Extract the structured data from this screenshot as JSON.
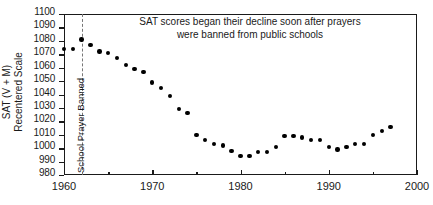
{
  "chart_data": {
    "type": "scatter",
    "title": "",
    "annotation": "SAT scores began their decline soon after prayers were banned from public schools",
    "annotation_line1": "SAT scores began their decline soon after prayers",
    "annotation_line2": "were banned from public schools",
    "xlabel": "",
    "ylabel": "SAT (V + M)  Recentered Scale",
    "ylabel_line1": "SAT (V + M)",
    "ylabel_line2": "Recentered Scale",
    "xlim": [
      1960,
      2000
    ],
    "ylim": [
      980,
      1100
    ],
    "xticks": [
      1960,
      1970,
      1980,
      1990,
      2000
    ],
    "xticklabels": [
      "1960",
      "1970",
      "1980",
      "1990",
      "2000"
    ],
    "xminorticks": [
      1965,
      1975,
      1985,
      1995
    ],
    "yticks": [
      980,
      990,
      1000,
      1010,
      1020,
      1030,
      1040,
      1050,
      1060,
      1070,
      1080,
      1090,
      1100
    ],
    "yticklabels": [
      "980",
      "990",
      "1000",
      "1010",
      "1020",
      "1030",
      "1040",
      "1050",
      "1060",
      "1070",
      "1080",
      "1090",
      "1100"
    ],
    "grid": false,
    "legend": false,
    "marker": "filled-circle",
    "marker_color": "#000000",
    "vline": {
      "x": 1962,
      "label": "School Prayer Banned",
      "style": "dashed",
      "color": "#777777"
    },
    "x": [
      1960,
      1961,
      1962,
      1963,
      1964,
      1965,
      1966,
      1967,
      1968,
      1969,
      1970,
      1971,
      1972,
      1973,
      1974,
      1975,
      1976,
      1977,
      1978,
      1979,
      1980,
      1981,
      1982,
      1983,
      1984,
      1985,
      1986,
      1987,
      1988,
      1989,
      1990,
      1991,
      1992,
      1993,
      1994,
      1995,
      1996,
      1997
    ],
    "y": [
      1074,
      1074,
      1081,
      1077,
      1072,
      1071,
      1067,
      1062,
      1059,
      1057,
      1049,
      1045,
      1039,
      1029,
      1026,
      1010,
      1006,
      1003,
      1002,
      998,
      994,
      994,
      997,
      997,
      1001,
      1009,
      1009,
      1008,
      1006,
      1006,
      1001,
      999,
      1001,
      1003,
      1003,
      1010,
      1013,
      1016
    ],
    "series_name": "SAT (V + M) Recentered Scale"
  }
}
